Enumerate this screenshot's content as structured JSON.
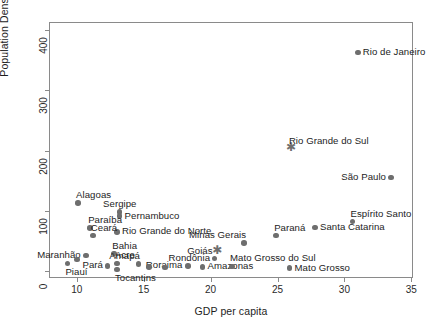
{
  "chart_data": {
    "type": "scatter",
    "title": "",
    "xlabel": "GDP per capita",
    "ylabel": "Population Density",
    "xlim": [
      8.0,
      35.2
    ],
    "ylim": [
      -12,
      412
    ],
    "xticks": [
      10,
      15,
      20,
      25,
      30,
      35
    ],
    "yticks": [
      0,
      100,
      200,
      300,
      400
    ],
    "grid": false,
    "legend": null,
    "marker_color": "#6e6e6e",
    "points": [
      {
        "label": "Rio de Janeiro",
        "x": 31.0,
        "y": 363,
        "marker": "circle",
        "label_pos": "right"
      },
      {
        "label": "Rio Grande do Sul",
        "x": 26.0,
        "y": 204,
        "marker": "star",
        "label_pos": "top-right"
      },
      {
        "label": "São Paulo",
        "x": 33.5,
        "y": 156,
        "marker": "circle",
        "label_pos": "left"
      },
      {
        "label": "Alagoas",
        "x": 10.1,
        "y": 114,
        "marker": "circle",
        "label_pos": "top-right"
      },
      {
        "label": "Sergipe",
        "x": 13.2,
        "y": 99,
        "marker": "circle",
        "label_pos": "top"
      },
      {
        "label": "Pernambuco",
        "x": 13.2,
        "y": 92,
        "marker": "circle",
        "label_pos": "right"
      },
      {
        "label": "Espírito Santo",
        "x": 30.6,
        "y": 83,
        "marker": "circle",
        "label_pos": "top-right"
      },
      {
        "label": "Santa Catarina",
        "x": 27.8,
        "y": 73,
        "marker": "circle",
        "label_pos": "right"
      },
      {
        "label": "Paraíba",
        "x": 11.0,
        "y": 72,
        "marker": "circle",
        "label_pos": "top-right"
      },
      {
        "label": "Rio Grande do Norte",
        "x": 13.0,
        "y": 66,
        "marker": "circle",
        "label_pos": "right"
      },
      {
        "label": "Ceará",
        "x": 11.2,
        "y": 60,
        "marker": "circle",
        "label_pos": "top-right"
      },
      {
        "label": "Paraná",
        "x": 24.9,
        "y": 60,
        "marker": "circle",
        "label_pos": "top-right"
      },
      {
        "label": "Minas Gerais",
        "x": 22.5,
        "y": 48,
        "marker": "circle",
        "label_pos": "top-left"
      },
      {
        "label": "Goiás",
        "x": 20.5,
        "y": 33,
        "marker": "star",
        "label_pos": "left"
      },
      {
        "label": "Bahia",
        "x": 12.8,
        "y": 30,
        "marker": "circle",
        "label_pos": "top-right"
      },
      {
        "label": "Rondônia",
        "x": 20.3,
        "y": 22,
        "marker": "circle",
        "label_pos": "left"
      },
      {
        "label": "Maranhão",
        "x": 10.7,
        "y": 27,
        "marker": "circle",
        "label_pos": "left"
      },
      {
        "label": "Amapá",
        "x": 14.6,
        "y": 13,
        "marker": "circle",
        "label_pos": "top-left"
      },
      {
        "label": "Acre",
        "x": 13.0,
        "y": 14,
        "marker": "circle",
        "label_pos": "top-right"
      },
      {
        "label": "Pará",
        "x": 12.3,
        "y": 10,
        "marker": "circle",
        "label_pos": "left"
      },
      {
        "label": "Roraima",
        "x": 18.3,
        "y": 10,
        "marker": "circle",
        "label_pos": "left"
      },
      {
        "label": "Amazonas",
        "x": 19.4,
        "y": 8,
        "marker": "circle",
        "label_pos": "right"
      },
      {
        "label": "Tocantins",
        "x": 13.0,
        "y": 4,
        "marker": "circle",
        "label_pos": "bottom-right"
      },
      {
        "label": "Mato Grosso do Sul",
        "x": 21.6,
        "y": 9,
        "marker": "circle",
        "label_pos": "top-right"
      },
      {
        "label": "Mato Grosso",
        "x": 25.9,
        "y": 6,
        "marker": "circle",
        "label_pos": "right"
      },
      {
        "label": "Piauí",
        "x": 9.3,
        "y": 14,
        "marker": "circle",
        "label_pos": "bottom-right"
      },
      {
        "label": "",
        "x": 10.0,
        "y": 20,
        "marker": "circle",
        "label_pos": "none"
      },
      {
        "label": "",
        "x": 15.4,
        "y": 8,
        "marker": "circle",
        "label_pos": "none"
      },
      {
        "label": "",
        "x": 16.6,
        "y": 7,
        "marker": "circle",
        "label_pos": "none"
      }
    ]
  }
}
